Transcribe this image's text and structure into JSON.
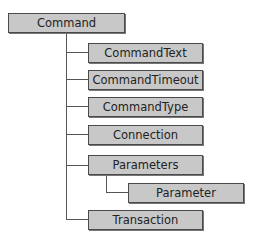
{
  "diagram": {
    "root": {
      "label": "Command"
    },
    "children": [
      {
        "label": "CommandText"
      },
      {
        "label": "CommandTimeout"
      },
      {
        "label": "CommandType"
      },
      {
        "label": "Connection"
      },
      {
        "label": "Parameters",
        "children": [
          {
            "label": "Parameter"
          }
        ]
      },
      {
        "label": "Transaction"
      }
    ]
  },
  "colors": {
    "box_fill": "#c8c8c8",
    "box_border": "#4a4a4a",
    "connector": "#555555",
    "text": "#222222"
  }
}
